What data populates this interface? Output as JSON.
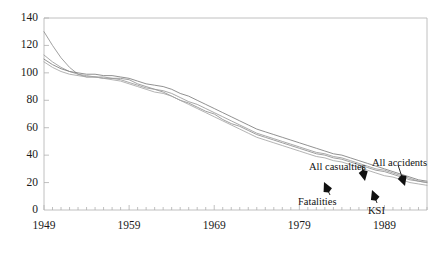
{
  "chart_data": {
    "type": "line",
    "title": "",
    "xlabel": "",
    "ylabel": "",
    "xlim": [
      1949,
      1994
    ],
    "ylim": [
      0,
      140
    ],
    "grid": false,
    "legend_position": "inline-annotations",
    "y_ticks": [
      0,
      20,
      40,
      60,
      80,
      100,
      120,
      140
    ],
    "x_ticks": [
      1949,
      1959,
      1969,
      1979,
      1989
    ],
    "x_minor_tick_interval": 1,
    "x": [
      1949,
      1950,
      1951,
      1952,
      1953,
      1954,
      1955,
      1956,
      1957,
      1958,
      1959,
      1960,
      1961,
      1962,
      1963,
      1964,
      1965,
      1966,
      1967,
      1968,
      1969,
      1970,
      1971,
      1972,
      1973,
      1974,
      1975,
      1976,
      1977,
      1978,
      1979,
      1980,
      1981,
      1982,
      1983,
      1984,
      1985,
      1986,
      1987,
      1988,
      1989,
      1990,
      1991,
      1992,
      1993,
      1994
    ],
    "series": [
      {
        "name": "Fatalities",
        "color": "#8f8f8f",
        "values": [
          130,
          120,
          111,
          104,
          99,
          97,
          97,
          96,
          96,
          96,
          95,
          92,
          90,
          88,
          86,
          83,
          80,
          78,
          75,
          72,
          70,
          66,
          63,
          61,
          58,
          55,
          53,
          51,
          49,
          47,
          45,
          43,
          41,
          40,
          38,
          37,
          35,
          33,
          31,
          29,
          28,
          26,
          24,
          22,
          21,
          20
        ]
      },
      {
        "name": "KSI",
        "color": "#9a9a9a",
        "values": [
          113,
          108,
          104,
          101,
          99,
          98,
          97,
          97,
          96,
          95,
          93,
          91,
          89,
          88,
          87,
          85,
          82,
          79,
          77,
          74,
          71,
          68,
          65,
          62,
          59,
          56,
          54,
          52,
          50,
          48,
          46,
          44,
          42,
          41,
          39,
          38,
          36,
          34,
          32,
          30,
          29,
          27,
          25,
          23,
          21,
          20
        ]
      },
      {
        "name": "All casualties",
        "color": "#7d7d7d",
        "values": [
          110,
          106,
          103,
          101,
          100,
          99,
          99,
          98,
          98,
          97,
          96,
          94,
          92,
          91,
          90,
          88,
          85,
          83,
          80,
          77,
          74,
          71,
          68,
          65,
          62,
          59,
          57,
          55,
          53,
          51,
          49,
          47,
          45,
          43,
          41,
          40,
          38,
          36,
          34,
          32,
          30,
          28,
          26,
          24,
          22,
          21
        ]
      },
      {
        "name": "All accidents",
        "color": "#a5a5a5",
        "values": [
          108,
          104,
          101,
          99,
          98,
          97,
          97,
          96,
          95,
          94,
          92,
          90,
          88,
          86,
          85,
          83,
          80,
          77,
          74,
          71,
          68,
          65,
          62,
          59,
          56,
          53,
          51,
          49,
          47,
          45,
          43,
          41,
          39,
          38,
          36,
          35,
          33,
          31,
          29,
          27,
          25,
          24,
          22,
          20,
          19,
          18
        ]
      }
    ],
    "annotations": [
      {
        "label": "All casualties",
        "text_x": 309,
        "text_y": 162,
        "arrow_from_x": 362,
        "arrow_from_y": 166,
        "arrow_to_x": 365,
        "arrow_to_y": 181
      },
      {
        "label": "All accidents",
        "text_x": 372,
        "text_y": 158,
        "arrow_from_x": 398,
        "arrow_from_y": 165,
        "arrow_to_x": 405,
        "arrow_to_y": 186
      },
      {
        "label": "Fatalities",
        "text_x": 298,
        "text_y": 197,
        "arrow_from_x": 330,
        "arrow_from_y": 195,
        "arrow_to_x": 324,
        "arrow_to_y": 182
      },
      {
        "label": "KSI",
        "text_x": 368,
        "text_y": 206,
        "arrow_from_x": 377,
        "arrow_from_y": 203,
        "arrow_to_x": 372,
        "arrow_to_y": 190
      }
    ],
    "axis_color": "#b0b0b0",
    "text_color": "#1a1a1a",
    "background": "#ffffff"
  }
}
